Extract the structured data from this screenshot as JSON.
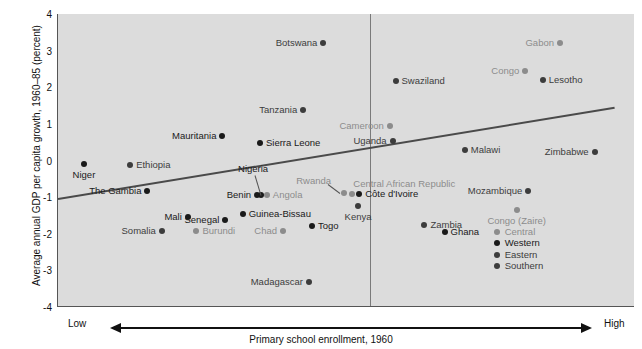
{
  "axes": {
    "ylabel": "Average annual GDP per capita growth, 1960–85 (percent)",
    "xlabel": "Primary school enrollment, 1960",
    "xlow": "Low",
    "xhigh": "High",
    "yticks": [
      "4",
      "3",
      "2",
      "1",
      "0",
      "-1",
      "-2",
      "-3",
      "-4"
    ]
  },
  "legend": {
    "items": [
      {
        "label": "Central",
        "color": "#8c8c8c"
      },
      {
        "label": "Western",
        "color": "#1a1a1a"
      },
      {
        "label": "Eastern",
        "color": "#3c3c3c"
      },
      {
        "label": "Southern",
        "color": "#3c3c3c"
      }
    ]
  },
  "colors": {
    "plot_background": "#dcdcdc",
    "central": "#8c8c8c",
    "western": "#1a1a1a",
    "eastern": "#3c3c3c",
    "southern": "#3c3c3c",
    "trendline": "#4a4a4a",
    "divider": "#7a7a7a"
  },
  "chart_data": {
    "type": "scatter",
    "title": "",
    "xlabel": "Primary school enrollment, 1960",
    "ylabel": "Average annual GDP per capita growth, 1960–85 (percent)",
    "ylim": [
      -4,
      4
    ],
    "xlim": [
      0,
      100
    ],
    "x_axis_note": "Primary school enrollment, 1960 — axis shown qualitatively from Low to High",
    "grid": false,
    "legend_position": "bottom-right",
    "trendline": {
      "x0": 0,
      "y0": -1.02,
      "x1": 96.5,
      "y1": 1.47
    },
    "divider_x": 54,
    "groups": {
      "Central": "#8c8c8c",
      "Western": "#1a1a1a",
      "Eastern": "#3c3c3c",
      "Southern": "#3c3c3c"
    },
    "points": [
      {
        "name": "Niger",
        "x": 4.5,
        "y": -0.1,
        "group": "Western",
        "side": "below"
      },
      {
        "name": "Ethiopia",
        "x": 12.5,
        "y": -0.12,
        "group": "Eastern",
        "side": "right"
      },
      {
        "name": "Mauritania",
        "x": 28.5,
        "y": 0.68,
        "group": "Western",
        "side": "left"
      },
      {
        "name": "Sierra Leone",
        "x": 35.0,
        "y": 0.48,
        "group": "Western",
        "side": "right"
      },
      {
        "name": "The Gambia",
        "x": 15.5,
        "y": -0.83,
        "group": "Western",
        "side": "left"
      },
      {
        "name": "Mali",
        "x": 22.5,
        "y": -1.55,
        "group": "Western",
        "side": "left"
      },
      {
        "name": "Senegal",
        "x": 29.0,
        "y": -1.62,
        "group": "Western",
        "side": "left"
      },
      {
        "name": "Somalia",
        "x": 18.0,
        "y": -1.93,
        "group": "Eastern",
        "side": "left"
      },
      {
        "name": "Burundi",
        "x": 24.0,
        "y": -1.93,
        "group": "Central",
        "side": "right"
      },
      {
        "name": "Benin",
        "x": 34.5,
        "y": -0.93,
        "group": "Western",
        "side": "left"
      },
      {
        "name": "Nigeria",
        "x": 35.2,
        "y": -0.93,
        "group": "Western",
        "side": "leader"
      },
      {
        "name": "Angola",
        "x": 36.2,
        "y": -0.93,
        "group": "Central",
        "side": "right"
      },
      {
        "name": "Guinea-Bissau",
        "x": 32.0,
        "y": -1.45,
        "group": "Western",
        "side": "right"
      },
      {
        "name": "Chad",
        "x": 39.0,
        "y": -1.92,
        "group": "Central",
        "side": "left"
      },
      {
        "name": "Togo",
        "x": 44.0,
        "y": -1.78,
        "group": "Western",
        "side": "right"
      },
      {
        "name": "Tanzania",
        "x": 42.5,
        "y": 1.38,
        "group": "Eastern",
        "side": "left"
      },
      {
        "name": "Botswana",
        "x": 46.0,
        "y": 3.22,
        "group": "Southern",
        "side": "left"
      },
      {
        "name": "Madagascar",
        "x": 43.5,
        "y": -3.33,
        "group": "Eastern",
        "side": "left"
      },
      {
        "name": "Rwanda",
        "x": 49.5,
        "y": -0.88,
        "group": "Central",
        "side": "leader"
      },
      {
        "name": "Central African Republic",
        "x": 51.0,
        "y": -0.92,
        "group": "Central",
        "side": "above"
      },
      {
        "name": "Côte d'Ivoire",
        "x": 52.2,
        "y": -0.92,
        "group": "Western",
        "side": "right"
      },
      {
        "name": "Kenya",
        "x": 52.0,
        "y": -1.25,
        "group": "Eastern",
        "side": "below"
      },
      {
        "name": "Swaziland",
        "x": 58.5,
        "y": 2.18,
        "group": "Southern",
        "side": "right"
      },
      {
        "name": "Cameroon",
        "x": 57.5,
        "y": 0.93,
        "group": "Central",
        "side": "left"
      },
      {
        "name": "Uganda",
        "x": 58.0,
        "y": 0.52,
        "group": "Eastern",
        "side": "left"
      },
      {
        "name": "Zambia",
        "x": 63.5,
        "y": -1.75,
        "group": "Southern",
        "side": "right"
      },
      {
        "name": "Ghana",
        "x": 67.0,
        "y": -1.95,
        "group": "Western",
        "side": "right"
      },
      {
        "name": "Malawi",
        "x": 70.5,
        "y": 0.28,
        "group": "Southern",
        "side": "right"
      },
      {
        "name": "Congo",
        "x": 81.0,
        "y": 2.45,
        "group": "Central",
        "side": "left"
      },
      {
        "name": "Lesotho",
        "x": 84.0,
        "y": 2.2,
        "group": "Southern",
        "side": "right"
      },
      {
        "name": "Gabon",
        "x": 87.0,
        "y": 3.2,
        "group": "Central",
        "side": "left"
      },
      {
        "name": "Mozambique",
        "x": 81.5,
        "y": -0.83,
        "group": "Southern",
        "side": "left"
      },
      {
        "name": "Congo (Zaire)",
        "x": 79.5,
        "y": -1.35,
        "group": "Central",
        "side": "below"
      },
      {
        "name": "Zimbabwe",
        "x": 93.0,
        "y": 0.22,
        "group": "Southern",
        "side": "left"
      }
    ]
  }
}
